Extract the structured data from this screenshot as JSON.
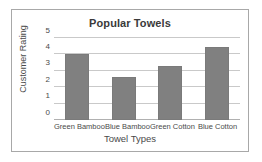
{
  "chart_data": {
    "type": "bar",
    "title": "Popular Towels",
    "xlabel": "Towel Types",
    "ylabel": "Customer Rating",
    "categories": [
      "Green Bamboo",
      "Blue Bamboo",
      "Green Cotton",
      "Blue Cotton"
    ],
    "values": [
      4.05,
      2.6,
      3.3,
      4.45
    ],
    "ylim": [
      0,
      5
    ],
    "yticks": [
      0,
      1,
      2,
      3,
      4,
      5
    ],
    "ytick_labels": [
      "0",
      "1",
      "2",
      "3",
      "4",
      "5"
    ],
    "grid": true,
    "legend": false,
    "bar_color": "#808080",
    "grid_color": "#c9c9c9",
    "text_color": "#4a4a4a",
    "frame_color": "#a8a8a8",
    "background": "#ffffff"
  }
}
